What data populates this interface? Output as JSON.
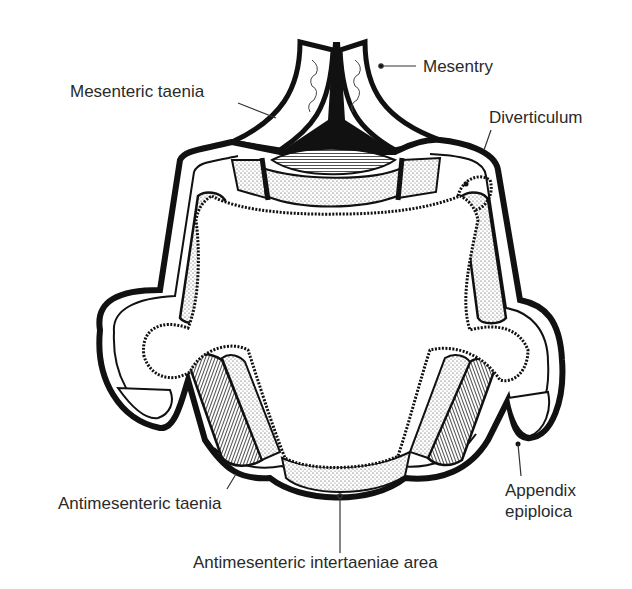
{
  "diagram": {
    "colors": {
      "ink": "#111111",
      "label_text": "#2a2a2a",
      "background": "#ffffff"
    },
    "labels": [
      {
        "id": "mesentry",
        "text": "Mesentry"
      },
      {
        "id": "mesenteric-taenia",
        "text": "Mesenteric taenia"
      },
      {
        "id": "diverticulum",
        "text": "Diverticulum"
      },
      {
        "id": "antimesenteric-taenia",
        "text": "Antimesenteric taenia"
      },
      {
        "id": "appendix-epiploica",
        "text": "Appendix\nepiploica"
      },
      {
        "id": "antimesenteric-intertaeniae-area",
        "text": "Antimesenteric intertaeniae area"
      }
    ]
  }
}
